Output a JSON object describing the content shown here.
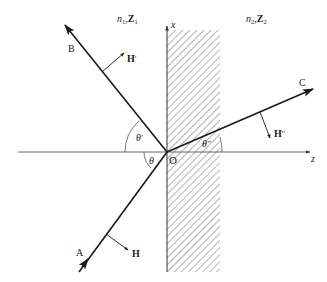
{
  "diagram": {
    "title": "",
    "type": "reflection-refraction-at-interface",
    "colors": {
      "line": "#1a1a1a",
      "axis": "#555555",
      "hatch": "#6b6b6b",
      "background": "#ffffff"
    },
    "media": {
      "left": {
        "n": "n",
        "n_sub": "1",
        "Z": "Z",
        "Z_sub": "1"
      },
      "right": {
        "n": "n",
        "n_sub": "2",
        "Z": "Z",
        "Z_sub": "2"
      }
    },
    "axes": {
      "x_label": "x",
      "z_label": "z",
      "origin_label": "O"
    },
    "rays": {
      "incident": {
        "label": "A",
        "field_label": "H"
      },
      "reflected": {
        "label": "B",
        "field_label": "H",
        "field_prime": "′"
      },
      "transmitted": {
        "label": "C",
        "field_label": "H",
        "field_prime": "′′"
      }
    },
    "angles": {
      "incident": {
        "symbol": "θ",
        "prime": ""
      },
      "reflected": {
        "symbol": "θ",
        "prime": "′"
      },
      "transmitted": {
        "symbol": "θ",
        "prime": "′′"
      }
    }
  }
}
